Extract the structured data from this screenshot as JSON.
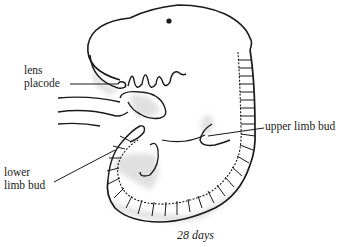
{
  "diagram": {
    "caption": "28 days",
    "labels": {
      "lens_placode_line1": "lens",
      "lens_placode_line2": "placode",
      "upper_limb_bud": "upper limb bud",
      "lower_limb_bud_line1": "lower",
      "lower_limb_bud_line2": "limb bud"
    },
    "colors": {
      "ink": "#1a1a1a",
      "shading": "#bfbfbf"
    }
  }
}
